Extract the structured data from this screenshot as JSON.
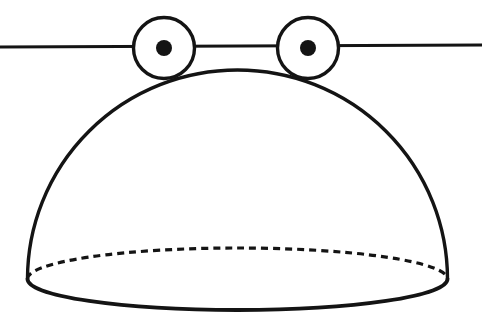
{
  "figure": {
    "name": "hemisphere-resting-on-two-rollers-line-drawing",
    "background_color": "#ffffff",
    "ink_color": "#141414",
    "fill_color": "#ffffff",
    "canvas": {
      "width": 482,
      "height": 325
    },
    "surface_line": {
      "x1": 0,
      "y1": 47,
      "x2": 482,
      "y2": 45,
      "stroke_width": 3
    },
    "rollers": [
      {
        "name": "left-roller",
        "cx": 164,
        "cy": 48,
        "r": 30.5,
        "stroke_width": 3.4,
        "dot_r": 8
      },
      {
        "name": "right-roller",
        "cx": 308,
        "cy": 48,
        "r": 30.5,
        "stroke_width": 3.4,
        "dot_r": 8
      }
    ],
    "dome": {
      "cx": 237.5,
      "base_y": 279,
      "rx": 210,
      "ry": 209,
      "stroke_width": 3.4
    },
    "base_ellipse": {
      "cx": 237.5,
      "cy": 279,
      "rx": 210,
      "ry": 31,
      "front_stroke_width": 3.8,
      "back_stroke_width": 3.2,
      "back_dash_pattern": "7 5"
    }
  }
}
